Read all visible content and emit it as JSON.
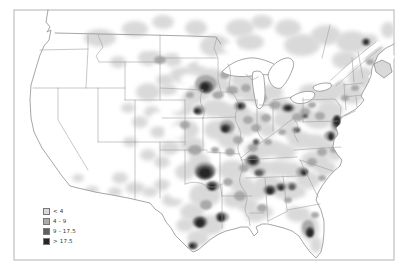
{
  "frame": {
    "border_color": "#b3b3b3"
  },
  "legend": {
    "items": [
      {
        "label": "< 4",
        "color": "#d9d9d9"
      },
      {
        "label": "4 - 9",
        "color": "#ababab"
      },
      {
        "label": "9 - 17.5",
        "color": "#5f5f5f"
      },
      {
        "label": "> 17.5",
        "color": "#262626"
      }
    ]
  },
  "map": {
    "description": "Shaded density map of the contiguous United States with four gray levels",
    "levels": {
      "0": "#ffffff",
      "1": "#d9d9d9",
      "2": "#a9a9a9",
      "3": "#5a5a5a",
      "4": "#262626"
    },
    "blobs": [
      [
        1,
        100,
        38,
        16,
        9
      ],
      [
        1,
        135,
        29,
        13,
        8
      ],
      [
        1,
        163,
        22,
        11,
        7
      ],
      [
        1,
        196,
        28,
        11,
        8
      ],
      [
        1,
        215,
        46,
        15,
        11
      ],
      [
        1,
        240,
        28,
        14,
        9
      ],
      [
        1,
        262,
        22,
        11,
        7
      ],
      [
        1,
        288,
        28,
        13,
        9
      ],
      [
        1,
        250,
        42,
        14,
        8
      ],
      [
        1,
        302,
        45,
        18,
        11
      ],
      [
        1,
        326,
        35,
        15,
        10
      ],
      [
        1,
        352,
        42,
        16,
        11
      ],
      [
        1,
        375,
        55,
        12,
        10
      ],
      [
        1,
        345,
        60,
        13,
        9
      ],
      [
        1,
        362,
        78,
        14,
        11
      ],
      [
        1,
        352,
        95,
        12,
        9
      ],
      [
        1,
        338,
        88,
        11,
        8
      ],
      [
        1,
        325,
        95,
        15,
        9
      ],
      [
        1,
        310,
        92,
        11,
        8
      ],
      [
        1,
        330,
        110,
        13,
        9
      ],
      [
        1,
        340,
        128,
        10,
        11
      ],
      [
        1,
        318,
        120,
        14,
        9
      ],
      [
        1,
        300,
        112,
        13,
        9
      ],
      [
        1,
        272,
        92,
        11,
        8
      ],
      [
        1,
        262,
        100,
        9,
        7
      ],
      [
        1,
        280,
        105,
        10,
        8
      ],
      [
        1,
        244,
        80,
        13,
        9
      ],
      [
        1,
        237,
        92,
        10,
        7
      ],
      [
        1,
        250,
        95,
        9,
        7
      ],
      [
        1,
        210,
        78,
        14,
        10
      ],
      [
        1,
        200,
        92,
        12,
        9
      ],
      [
        1,
        222,
        85,
        9,
        7
      ],
      [
        1,
        215,
        108,
        14,
        9
      ],
      [
        1,
        228,
        112,
        11,
        8
      ],
      [
        1,
        240,
        115,
        12,
        10
      ],
      [
        1,
        246,
        128,
        10,
        8
      ],
      [
        1,
        260,
        120,
        11,
        9
      ],
      [
        1,
        268,
        130,
        9,
        7
      ],
      [
        1,
        285,
        120,
        12,
        9
      ],
      [
        1,
        292,
        132,
        9,
        7
      ],
      [
        1,
        218,
        130,
        14,
        10
      ],
      [
        1,
        230,
        140,
        12,
        9
      ],
      [
        1,
        185,
        130,
        14,
        10
      ],
      [
        1,
        192,
        145,
        12,
        8
      ],
      [
        1,
        170,
        148,
        10,
        7
      ],
      [
        1,
        182,
        108,
        12,
        8
      ],
      [
        1,
        192,
        98,
        10,
        7
      ],
      [
        1,
        182,
        75,
        12,
        8
      ],
      [
        1,
        197,
        68,
        10,
        7
      ],
      [
        1,
        165,
        80,
        9,
        6
      ],
      [
        1,
        258,
        150,
        14,
        9
      ],
      [
        1,
        272,
        148,
        12,
        8
      ],
      [
        1,
        285,
        152,
        11,
        8
      ],
      [
        1,
        260,
        168,
        12,
        8
      ],
      [
        1,
        278,
        168,
        12,
        8
      ],
      [
        1,
        292,
        170,
        10,
        8
      ],
      [
        1,
        300,
        140,
        12,
        9
      ],
      [
        1,
        315,
        142,
        12,
        8
      ],
      [
        1,
        328,
        148,
        10,
        7
      ],
      [
        1,
        315,
        160,
        14,
        9
      ],
      [
        1,
        325,
        168,
        11,
        8
      ],
      [
        1,
        308,
        180,
        12,
        9
      ],
      [
        1,
        268,
        185,
        14,
        10
      ],
      [
        1,
        284,
        190,
        12,
        9
      ],
      [
        1,
        296,
        192,
        10,
        8
      ],
      [
        1,
        255,
        192,
        12,
        8
      ],
      [
        1,
        232,
        170,
        14,
        10
      ],
      [
        1,
        242,
        185,
        12,
        9
      ],
      [
        1,
        235,
        200,
        12,
        8
      ],
      [
        1,
        248,
        205,
        10,
        8
      ],
      [
        1,
        196,
        162,
        14,
        10
      ],
      [
        1,
        185,
        172,
        10,
        8
      ],
      [
        1,
        205,
        195,
        16,
        12
      ],
      [
        1,
        192,
        212,
        12,
        9
      ],
      [
        1,
        210,
        225,
        14,
        10
      ],
      [
        1,
        198,
        238,
        11,
        8
      ],
      [
        1,
        185,
        225,
        9,
        7
      ],
      [
        1,
        172,
        200,
        10,
        7
      ],
      [
        1,
        162,
        185,
        8,
        6
      ],
      [
        1,
        255,
        215,
        10,
        7
      ],
      [
        1,
        265,
        212,
        8,
        6
      ],
      [
        1,
        298,
        214,
        12,
        8
      ],
      [
        1,
        310,
        228,
        9,
        13
      ],
      [
        1,
        316,
        245,
        6,
        8
      ],
      [
        1,
        335,
        155,
        8,
        6
      ],
      [
        1,
        150,
        58,
        12,
        8
      ],
      [
        1,
        172,
        60,
        10,
        7
      ],
      [
        1,
        148,
        92,
        12,
        9
      ],
      [
        1,
        168,
        90,
        9,
        6
      ],
      [
        1,
        152,
        112,
        8,
        6
      ],
      [
        1,
        140,
        122,
        8,
        6
      ],
      [
        1,
        158,
        132,
        8,
        6
      ],
      [
        1,
        148,
        155,
        8,
        6
      ],
      [
        1,
        162,
        162,
        8,
        6
      ],
      [
        1,
        128,
        108,
        7,
        5
      ],
      [
        1,
        130,
        142,
        7,
        5
      ],
      [
        1,
        118,
        62,
        8,
        6
      ],
      [
        1,
        120,
        178,
        8,
        6
      ],
      [
        1,
        135,
        188,
        10,
        6
      ],
      [
        1,
        150,
        192,
        8,
        5
      ],
      [
        1,
        115,
        192,
        7,
        5
      ],
      [
        1,
        92,
        190,
        7,
        4
      ],
      [
        1,
        78,
        178,
        6,
        4
      ],
      [
        1,
        385,
        65,
        8,
        9
      ],
      [
        1,
        370,
        40,
        8,
        6
      ],
      [
        1,
        388,
        30,
        7,
        8
      ],
      [
        0,
        168,
        42,
        11,
        7
      ],
      [
        0,
        150,
        44,
        8,
        6
      ],
      [
        0,
        188,
        55,
        9,
        6
      ],
      [
        0,
        160,
        68,
        8,
        5
      ],
      [
        0,
        188,
        80,
        8,
        6
      ],
      [
        0,
        172,
        105,
        12,
        8
      ],
      [
        0,
        158,
        118,
        8,
        6
      ],
      [
        0,
        175,
        132,
        10,
        7
      ],
      [
        0,
        182,
        158,
        8,
        5
      ],
      [
        0,
        178,
        192,
        10,
        7
      ],
      [
        0,
        170,
        215,
        8,
        6
      ],
      [
        0,
        222,
        60,
        8,
        6
      ],
      [
        0,
        205,
        62,
        8,
        5
      ],
      [
        0,
        302,
        202,
        6,
        4
      ],
      [
        0,
        255,
        60,
        8,
        5
      ],
      [
        0,
        230,
        48,
        7,
        5
      ],
      [
        2,
        206,
        84,
        11,
        9
      ],
      [
        2,
        199,
        110,
        6,
        5
      ],
      [
        2,
        218,
        95,
        6,
        4
      ],
      [
        2,
        227,
        127,
        8,
        7
      ],
      [
        2,
        240,
        106,
        6,
        5
      ],
      [
        2,
        248,
        120,
        5,
        4
      ],
      [
        2,
        238,
        140,
        5,
        4
      ],
      [
        2,
        256,
        128,
        5,
        4
      ],
      [
        2,
        266,
        118,
        5,
        4
      ],
      [
        2,
        262,
        98,
        5,
        4
      ],
      [
        2,
        275,
        105,
        6,
        4
      ],
      [
        2,
        288,
        108,
        7,
        5
      ],
      [
        2,
        298,
        117,
        6,
        4
      ],
      [
        2,
        305,
        112,
        5,
        4
      ],
      [
        2,
        232,
        90,
        6,
        4
      ],
      [
        2,
        246,
        88,
        5,
        4
      ],
      [
        2,
        225,
        75,
        5,
        4
      ],
      [
        2,
        195,
        150,
        7,
        5
      ],
      [
        2,
        205,
        171,
        11,
        9
      ],
      [
        2,
        213,
        186,
        7,
        5
      ],
      [
        2,
        200,
        222,
        8,
        6
      ],
      [
        2,
        222,
        217,
        7,
        5
      ],
      [
        2,
        193,
        245,
        5,
        4
      ],
      [
        2,
        206,
        205,
        6,
        5
      ],
      [
        2,
        240,
        196,
        6,
        5
      ],
      [
        2,
        252,
        162,
        8,
        6
      ],
      [
        2,
        260,
        172,
        6,
        4
      ],
      [
        2,
        270,
        190,
        7,
        5
      ],
      [
        2,
        281,
        187,
        6,
        4
      ],
      [
        2,
        292,
        186,
        5,
        4
      ],
      [
        2,
        302,
        172,
        6,
        5
      ],
      [
        2,
        312,
        162,
        5,
        4
      ],
      [
        2,
        322,
        152,
        5,
        4
      ],
      [
        2,
        330,
        136,
        6,
        5
      ],
      [
        2,
        337,
        123,
        6,
        8
      ],
      [
        2,
        320,
        116,
        5,
        4
      ],
      [
        2,
        312,
        105,
        4,
        3
      ],
      [
        2,
        345,
        98,
        4,
        3
      ],
      [
        2,
        355,
        88,
        4,
        3
      ],
      [
        2,
        366,
        42,
        5,
        4
      ],
      [
        2,
        370,
        62,
        4,
        3
      ],
      [
        2,
        308,
        228,
        6,
        8
      ],
      [
        2,
        315,
        215,
        4,
        3
      ],
      [
        2,
        185,
        125,
        5,
        4
      ],
      [
        2,
        160,
        60,
        6,
        4
      ],
      [
        2,
        253,
        148,
        5,
        4
      ],
      [
        2,
        268,
        142,
        4,
        3
      ],
      [
        2,
        282,
        132,
        4,
        3
      ],
      [
        2,
        296,
        130,
        4,
        3
      ],
      [
        2,
        230,
        152,
        5,
        4
      ],
      [
        2,
        244,
        168,
        5,
        4
      ],
      [
        2,
        228,
        182,
        5,
        4
      ],
      [
        2,
        262,
        208,
        5,
        4
      ],
      [
        2,
        288,
        200,
        4,
        3
      ],
      [
        2,
        322,
        178,
        4,
        3
      ],
      [
        2,
        334,
        150,
        4,
        3
      ],
      [
        2,
        215,
        150,
        4,
        3
      ],
      [
        2,
        190,
        95,
        4,
        3
      ],
      [
        3,
        206,
        87,
        7,
        6
      ],
      [
        3,
        198,
        111,
        4,
        3
      ],
      [
        3,
        226,
        128,
        5,
        4
      ],
      [
        3,
        241,
        106,
        4,
        3
      ],
      [
        3,
        288,
        108,
        5,
        3
      ],
      [
        3,
        253,
        160,
        6,
        5
      ],
      [
        3,
        259,
        173,
        4,
        3
      ],
      [
        3,
        205,
        172,
        9,
        7
      ],
      [
        3,
        212,
        186,
        5,
        4
      ],
      [
        3,
        200,
        222,
        6,
        5
      ],
      [
        3,
        221,
        217,
        4,
        4
      ],
      [
        3,
        193,
        246,
        4,
        3
      ],
      [
        3,
        270,
        190,
        5,
        4
      ],
      [
        3,
        281,
        187,
        4,
        3
      ],
      [
        3,
        292,
        187,
        3,
        3
      ],
      [
        3,
        304,
        172,
        4,
        3
      ],
      [
        3,
        310,
        232,
        4,
        5
      ],
      [
        3,
        337,
        122,
        4,
        6
      ],
      [
        3,
        331,
        136,
        3,
        4
      ],
      [
        3,
        366,
        42,
        3,
        3
      ],
      [
        3,
        305,
        116,
        3,
        2
      ],
      [
        3,
        297,
        130,
        3,
        2
      ],
      [
        3,
        256,
        142,
        3,
        3
      ],
      [
        4,
        205,
        87,
        4,
        4
      ],
      [
        4,
        225,
        129,
        3,
        3
      ],
      [
        4,
        240,
        106,
        2,
        2
      ],
      [
        4,
        253,
        161,
        3,
        3
      ],
      [
        4,
        205,
        173,
        6,
        5
      ],
      [
        4,
        212,
        187,
        3,
        3
      ],
      [
        4,
        200,
        223,
        4,
        4
      ],
      [
        4,
        221,
        218,
        3,
        3
      ],
      [
        4,
        270,
        191,
        3,
        3
      ],
      [
        4,
        281,
        188,
        2,
        2
      ],
      [
        4,
        304,
        173,
        2,
        2
      ],
      [
        4,
        310,
        233,
        3,
        4
      ],
      [
        4,
        337,
        121,
        3,
        5
      ],
      [
        4,
        331,
        137,
        2,
        3
      ],
      [
        4,
        288,
        108,
        3,
        2
      ],
      [
        4,
        192,
        246,
        2,
        2
      ],
      [
        4,
        366,
        42,
        2,
        2
      ],
      [
        4,
        197,
        111,
        2,
        2
      ]
    ]
  }
}
